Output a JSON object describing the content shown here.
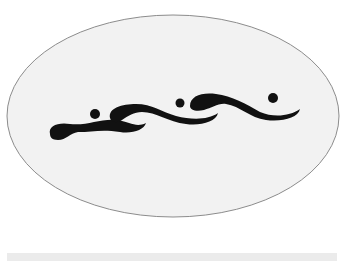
{
  "figure": {
    "colors": {
      "background": "#ffffff",
      "oval_fill": "#f2f2f2",
      "oval_stroke": "#8c8c8c",
      "shape_fill": "#111111",
      "bottom_bar": "#ebebeb"
    }
  }
}
